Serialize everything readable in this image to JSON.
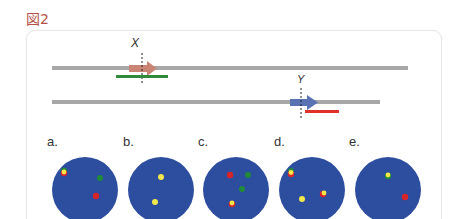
{
  "figure": {
    "title": "図2",
    "colors": {
      "title": "#b5534a",
      "dna_line": "#a7a7a7",
      "arrow_x": "#c98474",
      "arrow_y": "#5872b4",
      "bar_x": "#2f8a3c",
      "bar_y": "#e0302a",
      "dish": "#2d4e9e",
      "dot_red": "#d9242a",
      "dot_green": "#1f8a3a",
      "dot_yellow": "#f3e84a"
    },
    "genes": [
      {
        "label": "X",
        "strand": "upper",
        "arrow_color": "arrow_x",
        "bar_color": "bar_x"
      },
      {
        "label": "Y",
        "strand": "lower",
        "arrow_color": "arrow_y",
        "bar_color": "bar_y"
      }
    ],
    "panels": [
      {
        "label": "a.",
        "dots": [
          "yellow-red-green overlap",
          "green",
          "red"
        ]
      },
      {
        "label": "b.",
        "dots": [
          "yellow",
          "yellow"
        ]
      },
      {
        "label": "c.",
        "dots": [
          "red",
          "green",
          "green",
          "yellow-red overlap"
        ]
      },
      {
        "label": "d.",
        "dots": [
          "green-yellow-red overlap",
          "yellow",
          "yellow-red overlap"
        ]
      },
      {
        "label": "e.",
        "dots": [
          "yellow-green overlap",
          "red"
        ]
      }
    ]
  }
}
